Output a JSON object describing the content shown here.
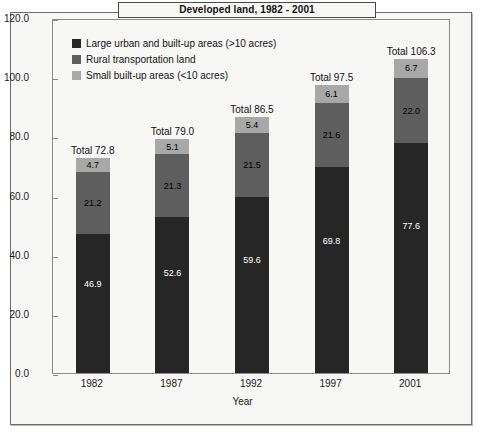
{
  "figure": {
    "title": "Developed land, 1982 - 2001"
  },
  "axes": {
    "y_title": "Million acres",
    "x_title": "Year",
    "y_ticks": [
      "0.0",
      "20.0",
      "40.0",
      "60.0",
      "80.0",
      "100.0",
      "120.0"
    ],
    "x_ticks": [
      "1982",
      "1987",
      "1992",
      "1997",
      "2001"
    ]
  },
  "legend": {
    "items": [
      {
        "label": "Large urban and built-up areas (>10 acres)",
        "color": "#262626",
        "swatch_name": "legend-swatch-large-urban"
      },
      {
        "label": "Rural transportation land",
        "color": "#5e5e5e",
        "swatch_name": "legend-swatch-rural-transportation"
      },
      {
        "label": "Small built-up areas (<10 acres)",
        "color": "#a8a8a8",
        "swatch_name": "legend-swatch-small-built-up"
      }
    ]
  },
  "bars": [
    {
      "year": "1982",
      "total_label": "Total 72.8",
      "segments": [
        {
          "label": "4.7",
          "value": 4.7,
          "series": "Small built-up areas (<10 acres)"
        },
        {
          "label": "21.2",
          "value": 21.2,
          "series": "Rural transportation land"
        },
        {
          "label": "46.9",
          "value": 46.9,
          "series": "Large urban and built-up areas (>10 acres)"
        }
      ]
    },
    {
      "year": "1987",
      "total_label": "Total 79.0",
      "segments": [
        {
          "label": "5.1",
          "value": 5.1,
          "series": "Small built-up areas (<10 acres)"
        },
        {
          "label": "21.3",
          "value": 21.3,
          "series": "Rural transportation land"
        },
        {
          "label": "52.6",
          "value": 52.6,
          "series": "Large urban and built-up areas (>10 acres)"
        }
      ]
    },
    {
      "year": "1992",
      "total_label": "Total 86.5",
      "segments": [
        {
          "label": "5.4",
          "value": 5.4,
          "series": "Small built-up areas (<10 acres)"
        },
        {
          "label": "21.5",
          "value": 21.5,
          "series": "Rural transportation land"
        },
        {
          "label": "59.6",
          "value": 59.6,
          "series": "Large urban and built-up areas (>10 acres)"
        }
      ]
    },
    {
      "year": "1997",
      "total_label": "Total 97.5",
      "segments": [
        {
          "label": "6.1",
          "value": 6.1,
          "series": "Small built-up areas (<10 acres)"
        },
        {
          "label": "21.6",
          "value": 21.6,
          "series": "Rural transportation land"
        },
        {
          "label": "69.8",
          "value": 69.8,
          "series": "Large urban and built-up areas (>10 acres)"
        }
      ]
    },
    {
      "year": "2001",
      "total_label": "Total 106.3",
      "segments": [
        {
          "label": "6.7",
          "value": 6.7,
          "series": "Small built-up areas (<10 acres)"
        },
        {
          "label": "22.0",
          "value": 22.0,
          "series": "Rural transportation land"
        },
        {
          "label": "77.6",
          "value": 77.6,
          "series": "Large urban and built-up areas (>10 acres)"
        }
      ]
    }
  ],
  "chart_data": {
    "type": "bar",
    "subtype": "stacked-vertical",
    "title": "Developed land, 1982 - 2001",
    "xlabel": "Year",
    "ylabel": "Million acres",
    "ylim": [
      0,
      120
    ],
    "ytick_step": 20,
    "grid": false,
    "legend_position": "inside-top-left",
    "categories": [
      "1982",
      "1987",
      "1992",
      "1997",
      "2001"
    ],
    "series": [
      {
        "name": "Large urban and built-up areas (>10 acres)",
        "color": "#262626",
        "values": [
          46.9,
          52.6,
          59.6,
          69.8,
          77.6
        ]
      },
      {
        "name": "Rural transportation land",
        "color": "#5e5e5e",
        "values": [
          21.2,
          21.3,
          21.5,
          21.6,
          22.0
        ]
      },
      {
        "name": "Small built-up areas (<10 acres)",
        "color": "#a8a8a8",
        "values": [
          4.7,
          5.1,
          5.4,
          6.1,
          6.7
        ]
      }
    ],
    "totals": [
      72.8,
      79.0,
      86.5,
      97.5,
      106.3
    ],
    "annotations": [
      "Total 72.8",
      "Total 79.0",
      "Total 86.5",
      "Total 97.5",
      "Total 106.3"
    ]
  }
}
